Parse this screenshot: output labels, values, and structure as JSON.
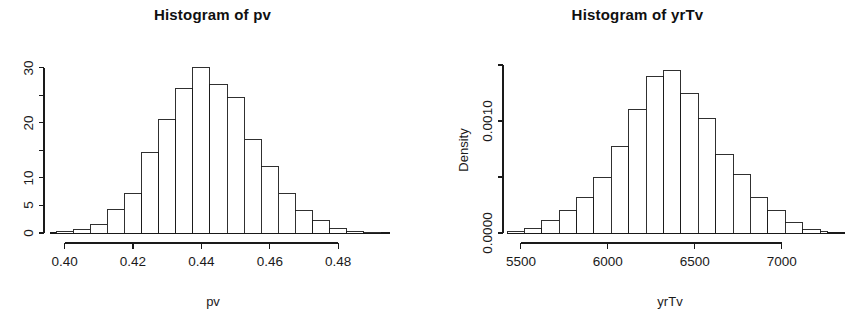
{
  "figure": {
    "background": "#ffffff",
    "foreground": "#1a1a1a",
    "width": 850,
    "height": 317,
    "panels": 2
  },
  "panels": [
    {
      "id": "pv",
      "title": "Histogram of pv",
      "xlabel": "pv",
      "ylabel": "",
      "x_tick_labels": [
        "0.40",
        "0.42",
        "0.44",
        "0.46",
        "0.48"
      ],
      "y_tick_labels": [
        "0",
        "5",
        "10",
        "20",
        "30"
      ]
    },
    {
      "id": "yrTv",
      "title": "Histogram of yrTv",
      "xlabel": "yrTv",
      "ylabel": "Density",
      "x_tick_labels": [
        "5500",
        "6000",
        "6500",
        "7000"
      ],
      "y_tick_labels": [
        "0.0000",
        "0.0010"
      ]
    }
  ],
  "chart_data": [
    {
      "type": "bar",
      "subtype": "histogram",
      "title": "Histogram of pv",
      "xlabel": "pv",
      "ylabel": "Frequency",
      "grid": false,
      "legend": false,
      "legend_position": "none",
      "bin_width": 0.005,
      "xlim": [
        0.3975,
        0.4925
      ],
      "ylim": [
        0,
        31
      ],
      "xticks": [
        0.4,
        0.42,
        0.44,
        0.46,
        0.48
      ],
      "xtick_labels": [
        "0.40",
        "0.42",
        "0.44",
        "0.46",
        "0.48"
      ],
      "yticks": [
        0,
        5,
        10,
        15,
        20,
        25,
        30
      ],
      "ytick_labels": [
        "0",
        "5",
        "10",
        "",
        "20",
        "",
        "30"
      ],
      "bin_edges": [
        0.3975,
        0.4025,
        0.4075,
        0.4125,
        0.4175,
        0.4225,
        0.4275,
        0.4325,
        0.4375,
        0.4425,
        0.4475,
        0.4525,
        0.4575,
        0.4625,
        0.4675,
        0.4725,
        0.4775,
        0.4825,
        0.4875,
        0.4925
      ],
      "categories": [
        "0.3975-0.4025",
        "0.4025-0.4075",
        "0.4075-0.4125",
        "0.4125-0.4175",
        "0.4175-0.4225",
        "0.4225-0.4275",
        "0.4275-0.4325",
        "0.4325-0.4375",
        "0.4375-0.4425",
        "0.4425-0.4475",
        "0.4475-0.4525",
        "0.4525-0.4575",
        "0.4575-0.4625",
        "0.4625-0.4675",
        "0.4675-0.4725",
        "0.4725-0.4775",
        "0.4775-0.4825",
        "0.4825-0.4875",
        "0.4875-0.4925"
      ],
      "values": [
        0.2,
        0.6,
        1.6,
        4.2,
        7.2,
        14.6,
        20.5,
        26.2,
        30.0,
        27.0,
        24.5,
        17.0,
        12.0,
        7.2,
        4.0,
        2.2,
        0.9,
        0.2,
        0.1
      ]
    },
    {
      "type": "bar",
      "subtype": "histogram",
      "title": "Histogram of yrTv",
      "xlabel": "yrTv",
      "ylabel": "Density",
      "grid": false,
      "legend": false,
      "legend_position": "none",
      "bin_width": 100,
      "xlim": [
        5420,
        7260
      ],
      "ylim": [
        0,
        0.0015
      ],
      "xticks": [
        5500,
        6000,
        6500,
        7000
      ],
      "xtick_labels": [
        "5500",
        "6000",
        "6500",
        "7000"
      ],
      "yticks": [
        0.0,
        0.0005,
        0.001,
        0.0015
      ],
      "ytick_labels": [
        "0.0000",
        "",
        "0.0010",
        ""
      ],
      "bin_edges": [
        5420,
        5520,
        5620,
        5720,
        5820,
        5920,
        6020,
        6120,
        6220,
        6320,
        6420,
        6520,
        6620,
        6720,
        6820,
        6920,
        7020,
        7120,
        7220,
        7260
      ],
      "categories": [
        "5420-5520",
        "5520-5620",
        "5620-5720",
        "5720-5820",
        "5820-5920",
        "5920-6020",
        "6020-6120",
        "6120-6220",
        "6220-6320",
        "6320-6420",
        "6420-6520",
        "6520-6620",
        "6620-6720",
        "6720-6820",
        "6820-6920",
        "6920-7020",
        "7020-7120",
        "7120-7220",
        "7220-7260"
      ],
      "values": [
        1e-05,
        4e-05,
        0.00011,
        0.0002,
        0.00032,
        0.0005,
        0.00077,
        0.0011,
        0.0014,
        0.00145,
        0.00125,
        0.00102,
        0.0007,
        0.00052,
        0.00032,
        0.0002,
        9e-05,
        3e-05,
        1e-05
      ]
    }
  ]
}
